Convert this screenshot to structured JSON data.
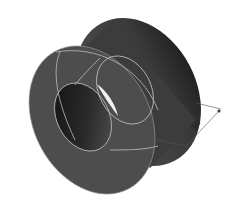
{
  "figure": {
    "dimension": {
      "label": "30",
      "description": "cylinder length / depth dimension"
    },
    "colors": {
      "background": "#ffffff",
      "body": "#4a4a4a",
      "body_dark": "#2e2e2e",
      "edge_lines": "#bdbdbd",
      "hole_inner": "#1a1a1a",
      "highlight": "#f4f4f4",
      "dimension_line": "#555555"
    }
  }
}
